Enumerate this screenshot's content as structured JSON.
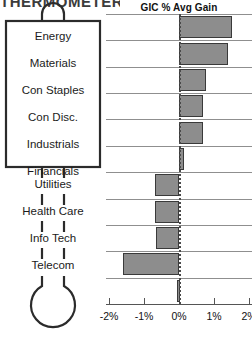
{
  "page": {
    "cut_off_heading": "THERMOMETER"
  },
  "thermometer": {
    "box_sectors": [
      "Energy",
      "Materials",
      "Con Staples",
      "Con Disc.",
      "Industrials",
      "Financials"
    ],
    "stem_sectors": [
      "Utilities",
      "Health Care",
      "Info Tech",
      "Telecom"
    ]
  },
  "chart_data": {
    "type": "bar",
    "orientation": "horizontal",
    "title": "GIC % Avg Gain",
    "xlabel": "",
    "ylabel": "",
    "categories": [
      "Energy",
      "Materials",
      "Con Staples",
      "Con Disc.",
      "Industrials",
      "Financials",
      "Utilities",
      "Health Care",
      "Info Tech",
      "Telecom",
      ""
    ],
    "values": [
      1.52,
      1.41,
      0.78,
      0.68,
      0.68,
      0.15,
      -0.68,
      -0.68,
      -0.66,
      -1.61,
      -0.06
    ],
    "xlim": [
      -2,
      2
    ],
    "xticks": [
      -2,
      -1,
      0,
      1,
      2
    ],
    "xticklabels": [
      "-2%",
      "-1%",
      "0%",
      "1%",
      "2%"
    ],
    "grid": "horizontal-row-separators",
    "zero_line": "dotted",
    "legend": "none",
    "bar_fill": "#8d8d8d",
    "bar_stroke": "#3a3a3a"
  },
  "colors": {
    "bar_fill": "#8d8d8d",
    "bar_stroke": "#3a3a3a",
    "line": "#8f8f8f",
    "axis": "#555555",
    "text": "#1a1a1a"
  }
}
